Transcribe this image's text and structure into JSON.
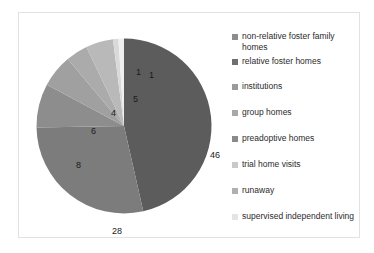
{
  "chart_data": {
    "type": "pie",
    "title": "",
    "unit": "percent",
    "legend_position": "right",
    "grid": false,
    "total": 99,
    "categories": [
      "non-relative foster family homes",
      "relative foster homes",
      "institutions",
      "group homes",
      "preadoptive homes",
      "trial home visits",
      "runaway",
      "supervised independent living"
    ],
    "values": [
      46,
      28,
      8,
      6,
      4,
      5,
      1,
      1
    ],
    "colors": [
      "#5c5c5c",
      "#7c7c7c",
      "#8d8d8d",
      "#a0a0a0",
      "#ababab",
      "#b9b9b9",
      "#d9d9d9",
      "#efefef"
    ],
    "slices": [
      {
        "label": "non-relative foster family homes",
        "value": 46,
        "display": "46",
        "color": "#5c5c5c",
        "start_deg": 0,
        "end_deg": 167.27,
        "label_x": 174,
        "label_y": 114
      },
      {
        "label": "relative foster homes",
        "value": 28,
        "display": "28",
        "color": "#7c7c7c",
        "start_deg": 167.27,
        "end_deg": 269.09,
        "label_x": 76,
        "label_y": 190
      },
      {
        "label": "institutions",
        "value": 8,
        "display": "8",
        "color": "#8d8d8d",
        "start_deg": 269.09,
        "end_deg": 298.18,
        "label_x": 40,
        "label_y": 124
      },
      {
        "label": "group homes",
        "value": 6,
        "display": "6",
        "color": "#a0a0a0",
        "start_deg": 298.18,
        "end_deg": 320.0,
        "label_x": 55,
        "label_y": 90
      },
      {
        "label": "preadoptive homes",
        "value": 4,
        "display": "4",
        "color": "#ababab",
        "start_deg": 320.0,
        "end_deg": 334.55,
        "label_x": 75,
        "label_y": 72
      },
      {
        "label": "trial home visits",
        "value": 5,
        "display": "5",
        "color": "#b9b9b9",
        "start_deg": 334.55,
        "end_deg": 352.73,
        "label_x": 97,
        "label_y": 58
      },
      {
        "label": "runaway",
        "value": 1,
        "display": "1",
        "color": "#d9d9d9",
        "start_deg": 352.73,
        "end_deg": 356.36,
        "label_x": 100,
        "label_y": 31
      },
      {
        "label": "supervised independent living",
        "value": 1,
        "display": "1",
        "color": "#efefef",
        "start_deg": 356.36,
        "end_deg": 360.0,
        "label_x": 113,
        "label_y": 34
      }
    ]
  },
  "legend": {
    "items": [
      {
        "label": "non-relative foster family homes",
        "color": "#8d8d8d",
        "top": 10,
        "lines": 2
      },
      {
        "label": "relative foster homes",
        "color": "#6f6f6f",
        "top": 35,
        "lines": 1
      },
      {
        "label": "institutions",
        "color": "#9b9b9b",
        "top": 60,
        "lines": 1
      },
      {
        "label": "group homes",
        "color": "#a8a8a8",
        "top": 86,
        "lines": 1
      },
      {
        "label": "preadoptive homes",
        "color": "#8a8a8a",
        "top": 112,
        "lines": 1
      },
      {
        "label": "trial home visits",
        "color": "#c9c9c9",
        "top": 138,
        "lines": 1
      },
      {
        "label": "runaway",
        "color": "#b0b0b0",
        "top": 164,
        "lines": 1
      },
      {
        "label": "supervised independent living",
        "color": "#e4e4e4",
        "top": 190,
        "lines": 2
      }
    ]
  }
}
